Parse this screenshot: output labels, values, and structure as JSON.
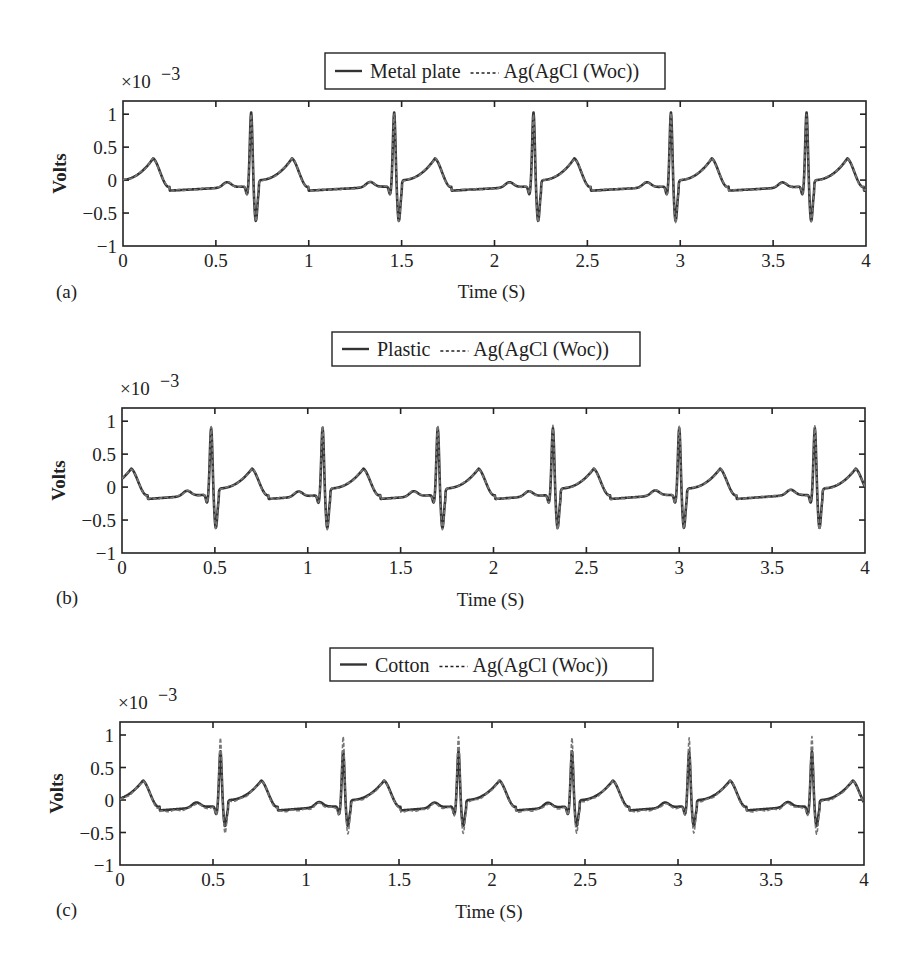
{
  "figure": {
    "common": {
      "xlabel": "Time (S)",
      "ylabel": "Volts",
      "y_multiplier": "×10",
      "y_exponent": "−3",
      "xticks": [
        "0",
        "0.5",
        "1",
        "1.5",
        "2",
        "2.5",
        "3",
        "3.5",
        "4"
      ],
      "yticks": [
        "1",
        "0.5",
        "0",
        "−0.5",
        "−1"
      ],
      "reference_label": "Ag(AgCl (Woc))"
    },
    "colors": {
      "solid": "#333333",
      "dashed": "#777777",
      "axis": "#222222"
    }
  },
  "chart_data": [
    {
      "panel": "(a)",
      "type": "line",
      "title": "",
      "xlabel": "Time (S)",
      "ylabel": "Volts",
      "y_scale": "×10^-3",
      "xlim": [
        0,
        4
      ],
      "ylim": [
        -1,
        1.2
      ],
      "grid": false,
      "legend_position": "top-center",
      "legend": [
        "Metal plate",
        "Ag(AgCl (Woc))"
      ],
      "series": [
        {
          "name": "Metal plate",
          "style": "solid",
          "r_peak_times_s": [
            0.69,
            1.46,
            2.21,
            2.95,
            3.68
          ],
          "r_peak_mV": 0.98,
          "s_trough_mV": -0.62,
          "t_wave_mV": 0.33,
          "baseline_mV": -0.1
        },
        {
          "name": "Ag(AgCl (Woc))",
          "style": "dashed",
          "r_peak_times_s": [
            0.69,
            1.46,
            2.21,
            2.95,
            3.68
          ],
          "r_peak_mV": 0.96,
          "s_trough_mV": -0.64,
          "t_wave_mV": 0.33,
          "baseline_mV": -0.1
        }
      ]
    },
    {
      "panel": "(b)",
      "type": "line",
      "title": "",
      "xlabel": "Time (S)",
      "ylabel": "Volts",
      "y_scale": "×10^-3",
      "xlim": [
        0,
        4
      ],
      "ylim": [
        -1,
        1.2
      ],
      "grid": false,
      "legend_position": "top-center",
      "legend": [
        "Plastic",
        "Ag(AgCl (Woc))"
      ],
      "series": [
        {
          "name": "Plastic",
          "style": "solid",
          "r_peak_times_s": [
            0.48,
            1.08,
            1.7,
            2.32,
            3.0,
            3.73
          ],
          "r_peak_mV": 0.85,
          "s_trough_mV": -0.62,
          "t_wave_mV": 0.28,
          "baseline_mV": -0.12
        },
        {
          "name": "Ag(AgCl (Woc))",
          "style": "dashed",
          "r_peak_times_s": [
            0.48,
            1.08,
            1.7,
            2.32,
            3.0,
            3.73
          ],
          "r_peak_mV": 0.88,
          "s_trough_mV": -0.64,
          "t_wave_mV": 0.28,
          "baseline_mV": -0.12
        }
      ]
    },
    {
      "panel": "(c)",
      "type": "line",
      "title": "",
      "xlabel": "Time (S)",
      "ylabel": "Volts",
      "y_scale": "×10^-3",
      "xlim": [
        0,
        4
      ],
      "ylim": [
        -1,
        1.2
      ],
      "grid": false,
      "legend_position": "top-center",
      "legend": [
        "Cotton",
        "Ag(AgCl (Woc))"
      ],
      "series": [
        {
          "name": "Cotton",
          "style": "solid",
          "r_peak_times_s": [
            0.54,
            1.2,
            1.82,
            2.43,
            3.06,
            3.72
          ],
          "r_peak_mV": 0.7,
          "s_trough_mV": -0.4,
          "t_wave_mV": 0.3,
          "baseline_mV": -0.1
        },
        {
          "name": "Ag(AgCl (Woc))",
          "style": "dashed",
          "r_peak_times_s": [
            0.54,
            1.2,
            1.82,
            2.43,
            3.06,
            3.72
          ],
          "r_peak_mV": 0.92,
          "s_trough_mV": -0.52,
          "t_wave_mV": 0.3,
          "baseline_mV": -0.12
        }
      ]
    }
  ]
}
